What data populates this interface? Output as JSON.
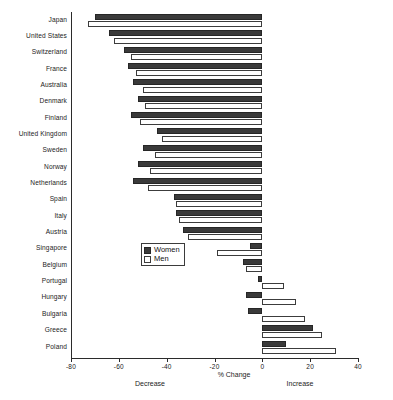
{
  "chart_data": {
    "type": "bar",
    "orientation": "horizontal",
    "title": "",
    "xlabel": "% Change",
    "ylabel": "",
    "xlim": [
      -80,
      40
    ],
    "xticks": [
      -80,
      -60,
      -40,
      -20,
      0,
      20,
      40
    ],
    "xtick_labels": [
      "-80",
      "-60",
      "-40",
      "-20",
      "0",
      "20",
      "40"
    ],
    "grid": false,
    "legend_position": "center-left-inside",
    "annotations": {
      "left_caption": "Decrease",
      "right_caption": "Increase"
    },
    "categories": [
      "Japan",
      "United States",
      "Switzerland",
      "France",
      "Australia",
      "Denmark",
      "Finland",
      "United Kingdom",
      "Sweden",
      "Norway",
      "Netherlands",
      "Spain",
      "Italy",
      "Austria",
      "Singapore",
      "Belgium",
      "Portugal",
      "Hungary",
      "Bulgaria",
      "Greece",
      "Poland"
    ],
    "series": [
      {
        "name": "Women",
        "color": "#3a3a3a",
        "values": [
          -70,
          -64,
          -58,
          -56,
          -54,
          -52,
          -55,
          -44,
          -50,
          -52,
          -54,
          -37,
          -36,
          -33,
          -5,
          -8,
          -2,
          -7,
          -6,
          21,
          10
        ]
      },
      {
        "name": "Men",
        "color": "#ffffff",
        "values": [
          -73,
          -62,
          -55,
          -53,
          -50,
          -49,
          -51,
          -42,
          -45,
          -47,
          -48,
          -36,
          -35,
          -31,
          -19,
          -7,
          9,
          14,
          18,
          25,
          31
        ]
      }
    ]
  }
}
